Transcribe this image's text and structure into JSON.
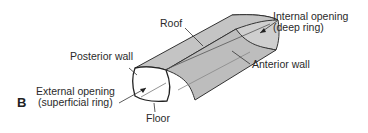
{
  "panel_label": "B",
  "labels": {
    "roof": "Roof",
    "posterior_wall": "Posterior wall",
    "internal_opening_line1": "Internal opening",
    "internal_opening_line2": "(deep ring)",
    "anterior_wall": "Anterior wall",
    "external_opening_line1": "External opening",
    "external_opening_line2": "(superficial ring)",
    "floor": "Floor"
  },
  "colors": {
    "tube_fill": "#c9c9c9",
    "tube_side": "#bdbdbd",
    "opening_fill": "#ffffff",
    "outline": "#333333"
  }
}
